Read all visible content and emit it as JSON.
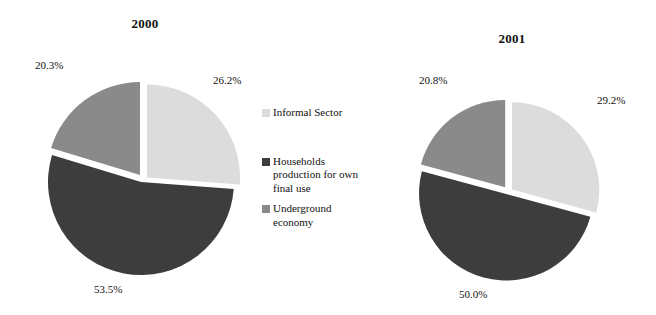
{
  "figure": {
    "background": "#ffffff"
  },
  "colors": {
    "informal_sector": "#dcdcdc",
    "households_production": "#3d3d3d",
    "underground_economy": "#8a8a8a",
    "text": "#111111"
  },
  "legend": {
    "items": [
      {
        "key": "informal_sector",
        "label": "Informal Sector",
        "color": "#dcdcdc"
      },
      {
        "key": "households_production",
        "label": "Households production for own final use",
        "color": "#3d3d3d"
      },
      {
        "key": "underground_economy",
        "label": "Underground economy",
        "color": "#8a8a8a"
      }
    ],
    "households_line1": "Households",
    "households_line2": "production for own",
    "households_line3": "final use",
    "underground_line1": "Underground",
    "underground_line2": "economy"
  },
  "charts": {
    "left": {
      "title": "2000",
      "labels": {
        "informal_sector": "26.2%",
        "households_production": "53.5%",
        "underground_economy": "20.3%"
      }
    },
    "right": {
      "title": "2001",
      "labels": {
        "informal_sector": "29.2%",
        "households_production": "50.0%",
        "underground_economy": "20.8%"
      }
    }
  },
  "chart_data": [
    {
      "type": "pie",
      "title": "2000",
      "categories": [
        "Informal Sector",
        "Households production for own final use",
        "Underground economy"
      ],
      "values": [
        26.2,
        53.5,
        20.3
      ],
      "unit": "percent",
      "colors": [
        "#dcdcdc",
        "#3d3d3d",
        "#8a8a8a"
      ],
      "exploded": true,
      "start_angle_deg": 0,
      "direction": "clockwise",
      "data_labels": [
        "26.2%",
        "53.5%",
        "20.3%"
      ],
      "legend_position": "center-right-shared"
    },
    {
      "type": "pie",
      "title": "2001",
      "categories": [
        "Informal Sector",
        "Households production for own final use",
        "Underground economy"
      ],
      "values": [
        29.2,
        50.0,
        20.8
      ],
      "unit": "percent",
      "colors": [
        "#dcdcdc",
        "#3d3d3d",
        "#8a8a8a"
      ],
      "exploded": true,
      "start_angle_deg": 0,
      "direction": "clockwise",
      "data_labels": [
        "29.2%",
        "50.0%",
        "20.8%"
      ],
      "legend_position": "center-right-shared"
    }
  ]
}
